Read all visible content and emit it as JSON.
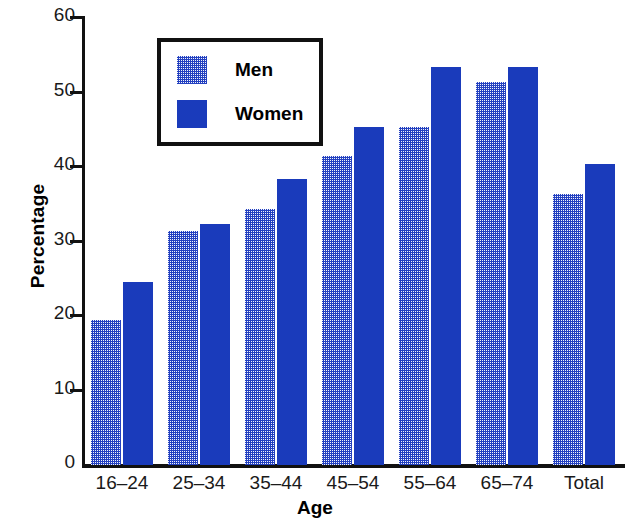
{
  "chart_data": {
    "type": "bar",
    "title": "",
    "xlabel": "Age",
    "ylabel": "Percentage",
    "categories": [
      "16–24",
      "25–34",
      "35–44",
      "45–54",
      "55–64",
      "65–74",
      "Total"
    ],
    "series": [
      {
        "name": "Men",
        "values": [
          19.5,
          31.4,
          34.4,
          41.5,
          45.4,
          51.4,
          36.4
        ],
        "color": "#2340c0",
        "fill": "halftone-checkerboard"
      },
      {
        "name": "Women",
        "values": [
          24.6,
          32.4,
          38.4,
          45.4,
          53.4,
          53.4,
          40.4
        ],
        "color": "#1a3bbb",
        "fill": "solid"
      }
    ],
    "ylim": [
      0,
      60
    ],
    "yticks": [
      0,
      10,
      20,
      30,
      40,
      50,
      60
    ],
    "ytick_labels": [
      "0",
      "10",
      "20",
      "30",
      "40",
      "50",
      "60"
    ],
    "grid": false,
    "legend_position": "top-left-inside",
    "legend_entries": [
      "Men",
      "Women"
    ]
  },
  "axis": {
    "y_title": "Percentage",
    "x_title": "Age"
  }
}
